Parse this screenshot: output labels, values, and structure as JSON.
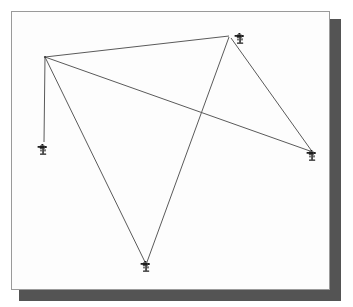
{
  "figure": {
    "kind": "network-diagram",
    "background_color": "#ffffff",
    "panel": {
      "background_color": "#fdfdfd",
      "border_color": "#9a9a9a",
      "shadow_color": "#545454",
      "x": 11,
      "y": 11,
      "width": 319,
      "height": 279,
      "shadow_x": 19,
      "shadow_y": 19,
      "shadow_width": 322,
      "shadow_height": 282
    },
    "line_color": "#5a5a5a",
    "marker_color": "#1d1d1d"
  },
  "nodes": [
    {
      "id": "hub",
      "label": "hub-station",
      "x": 45,
      "y": 57,
      "marker_x": 45,
      "marker_y": 57,
      "has_marker": false,
      "icon": "junction-node-icon"
    },
    {
      "id": "top",
      "label": "top-camera",
      "x": 229,
      "y": 36,
      "marker_x": 240,
      "marker_y": 38,
      "has_marker": true,
      "icon": "camera-tripod-icon"
    },
    {
      "id": "left",
      "label": "left-camera",
      "x": 44,
      "y": 142,
      "marker_x": 43,
      "marker_y": 149,
      "has_marker": true,
      "icon": "camera-tripod-icon"
    },
    {
      "id": "bottom",
      "label": "bottom-camera",
      "x": 146,
      "y": 263,
      "marker_x": 146,
      "marker_y": 266,
      "has_marker": true,
      "icon": "camera-tripod-icon"
    },
    {
      "id": "right",
      "label": "right-camera",
      "x": 311,
      "y": 151,
      "marker_x": 312,
      "marker_y": 155,
      "has_marker": true,
      "icon": "camera-tripod-icon"
    }
  ],
  "edges": [
    {
      "id": "hub-top",
      "from": "hub",
      "to": "top",
      "x1": 45,
      "y1": 57,
      "x2": 229,
      "y2": 36
    },
    {
      "id": "hub-left",
      "from": "hub",
      "to": "left",
      "x1": 45,
      "y1": 57,
      "x2": 44,
      "y2": 142
    },
    {
      "id": "hub-bottom",
      "from": "hub",
      "to": "bottom",
      "x1": 45,
      "y1": 57,
      "x2": 145,
      "y2": 262
    },
    {
      "id": "hub-right",
      "from": "hub",
      "to": "right",
      "x1": 45,
      "y1": 57,
      "x2": 310,
      "y2": 151
    },
    {
      "id": "top-bottom",
      "from": "top",
      "to": "bottom",
      "x1": 229,
      "y1": 37,
      "x2": 147,
      "y2": 262
    },
    {
      "id": "top-right",
      "from": "top",
      "to": "right",
      "x1": 231,
      "y1": 38,
      "x2": 311,
      "y2": 150
    }
  ],
  "crossing_points": [
    {
      "id": "cross-center",
      "x": 200,
      "y": 118
    }
  ]
}
